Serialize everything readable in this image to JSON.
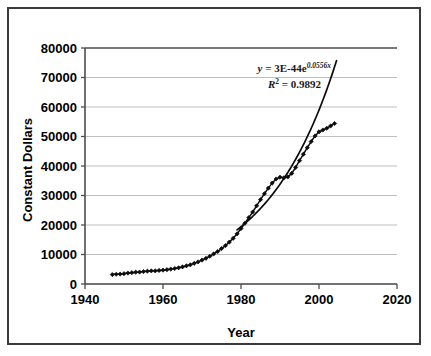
{
  "chart_data": {
    "type": "scatter",
    "title": "",
    "xlabel": "Year",
    "ylabel": "Constant Dollars",
    "xlim": [
      1940,
      2020
    ],
    "ylim": [
      0,
      80000
    ],
    "xticks": [
      "1940",
      "1960",
      "1980",
      "2000",
      "2020"
    ],
    "yticks": [
      "0",
      "10000",
      "20000",
      "30000",
      "40000",
      "50000",
      "60000",
      "70000",
      "80000"
    ],
    "grid": "horizontal",
    "legend": "none",
    "marker": "diamond",
    "series": [
      {
        "name": "Constant Dollars",
        "x": [
          1947,
          1948,
          1949,
          1950,
          1951,
          1952,
          1953,
          1954,
          1955,
          1956,
          1957,
          1958,
          1959,
          1960,
          1961,
          1962,
          1963,
          1964,
          1965,
          1966,
          1967,
          1968,
          1969,
          1970,
          1971,
          1972,
          1973,
          1974,
          1975,
          1976,
          1977,
          1978,
          1979,
          1980,
          1981,
          1982,
          1983,
          1984,
          1985,
          1986,
          1987,
          1988,
          1989,
          1990,
          1991,
          1992,
          1993,
          1994,
          1995,
          1996,
          1997,
          1998,
          1999,
          2000,
          2001,
          2002,
          2003,
          2004
        ],
        "values": [
          3200,
          3300,
          3350,
          3500,
          3700,
          3850,
          4000,
          4050,
          4200,
          4350,
          4450,
          4450,
          4600,
          4700,
          4850,
          5050,
          5250,
          5500,
          5800,
          6150,
          6500,
          7000,
          7500,
          8100,
          8700,
          9400,
          10200,
          11000,
          12000,
          13000,
          14200,
          15500,
          17000,
          18800,
          20600,
          22500,
          24400,
          26500,
          28600,
          30600,
          32500,
          34200,
          35600,
          36200,
          36000,
          36300,
          37500,
          39500,
          41800,
          44000,
          46200,
          48300,
          50200,
          51600,
          52200,
          52800,
          53600,
          54400
        ]
      }
    ],
    "trendline": {
      "type": "exponential",
      "equation": "y = 3E-44e",
      "equation_exponent": "0.0556x",
      "r_squared_label": "R",
      "r_squared_sup": "2",
      "r_squared_value": "= 0.9892",
      "coefficient": 3e-44,
      "rate": 0.0556,
      "r_squared": 0.9892,
      "x_start": 1979,
      "x_end": 2004.5
    },
    "colors": {
      "data": "#0d0d0d",
      "trendline": "#0d0d0d",
      "grid": "#bfbfbf",
      "axis": "#4d4d4d",
      "frame": "#3a3a3a",
      "text": "#000000"
    }
  }
}
